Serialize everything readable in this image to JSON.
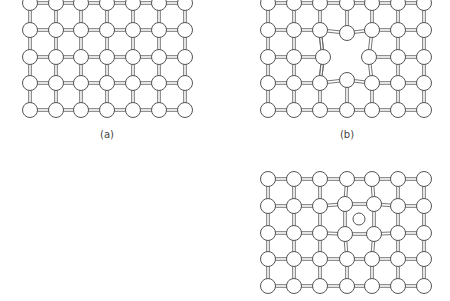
{
  "figure": {
    "panels": [
      {
        "id": "a",
        "label": "(a)",
        "description": "Perfect square crystal lattice",
        "label_pos": [
          107,
          135
        ],
        "cols_x": [
          30,
          56,
          81,
          107,
          133,
          159,
          185
        ],
        "rows_y": [
          3,
          30,
          57,
          83,
          110
        ],
        "defect": "none"
      },
      {
        "id": "b",
        "label": "(b)",
        "description": "Lattice with vacancy cluster causing relaxation of neighboring atoms",
        "label_pos": [
          347,
          135
        ],
        "cols_x": [
          268,
          294,
          320,
          347,
          372,
          398,
          424
        ],
        "rows_y": [
          3,
          30,
          57,
          83,
          110
        ],
        "defect": "vacancy"
      },
      {
        "id": "c",
        "label": "",
        "description": "Lattice with interstitial atom displacing neighbors outward",
        "cols_x": [
          268,
          294,
          320,
          347,
          372,
          398,
          424
        ],
        "rows_y": [
          179,
          206,
          233,
          259,
          286
        ],
        "defect": "interstitial",
        "interstitial_atom": [
          359,
          219
        ]
      }
    ],
    "style": {
      "node_radius": 7.5,
      "node_fill": "#ffffff",
      "node_stroke": "#555555",
      "bond_color": "#666666",
      "background": "#ffffff"
    }
  }
}
